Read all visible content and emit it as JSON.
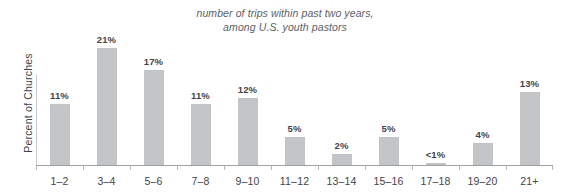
{
  "chart_data": {
    "type": "bar",
    "title": "number of trips within past two years,\namong U.S. youth pastors",
    "xlabel": "",
    "ylabel": "Percent of Churches",
    "ylim": [
      0,
      22
    ],
    "grid": false,
    "legend": "none",
    "categories": [
      "1–2",
      "3–4",
      "5–6",
      "7–8",
      "9–10",
      "11–12",
      "13–14",
      "15–16",
      "17–18",
      "19–20",
      "21+"
    ],
    "values": [
      11,
      21,
      17,
      11,
      12,
      5,
      2,
      5,
      0.4,
      4,
      13
    ],
    "value_labels": [
      "11%",
      "21%",
      "17%",
      "11%",
      "12%",
      "5%",
      "2%",
      "5%",
      "<1%",
      "4%",
      "13%"
    ],
    "bar_color": "#c3c5c7",
    "axis_color": "#9ea1a5",
    "text_color": "#3f444a",
    "title_color": "#5a5f66"
  }
}
